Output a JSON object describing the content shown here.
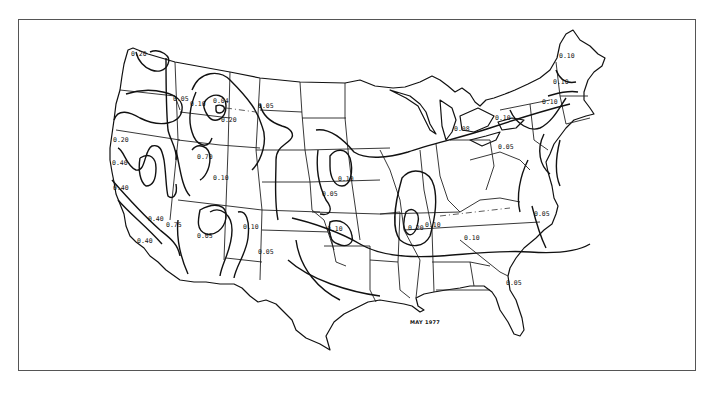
{
  "map": {
    "title_annotation": "MAY 1977",
    "subject": "Contour (isoline) map of the contiguous United States",
    "line_color": "#111111",
    "background": "#ffffff",
    "contour_labels": [
      {
        "text": "0.20",
        "x": 131,
        "y": 56
      },
      {
        "text": "0.05",
        "x": 173,
        "y": 101
      },
      {
        "text": "0.10",
        "x": 193,
        "y": 106
      },
      {
        "text": "0.04",
        "x": 215,
        "y": 103
      },
      {
        "text": "0.20",
        "x": 221,
        "y": 122
      },
      {
        "text": "0.05",
        "x": 258,
        "y": 108
      },
      {
        "text": "0.20",
        "x": 113,
        "y": 142
      },
      {
        "text": "0.40",
        "x": 112,
        "y": 165
      },
      {
        "text": "0.40",
        "x": 113,
        "y": 190
      },
      {
        "text": "0.70",
        "x": 197,
        "y": 159
      },
      {
        "text": "0.10",
        "x": 213,
        "y": 180
      },
      {
        "text": "0.40",
        "x": 148,
        "y": 221
      },
      {
        "text": "0.75",
        "x": 166,
        "y": 227
      },
      {
        "text": "0.40",
        "x": 137,
        "y": 243
      },
      {
        "text": "0.05",
        "x": 197,
        "y": 238
      },
      {
        "text": "0.10",
        "x": 243,
        "y": 229
      },
      {
        "text": "0.05",
        "x": 258,
        "y": 254
      },
      {
        "text": "0.10",
        "x": 338,
        "y": 181
      },
      {
        "text": "0.05",
        "x": 322,
        "y": 196
      },
      {
        "text": "0.10",
        "x": 327,
        "y": 231
      },
      {
        "text": "0.20",
        "x": 411,
        "y": 230
      },
      {
        "text": "0.10",
        "x": 427,
        "y": 227
      },
      {
        "text": "0.10",
        "x": 466,
        "y": 240
      },
      {
        "text": "0.05",
        "x": 536,
        "y": 216
      },
      {
        "text": "0.05",
        "x": 508,
        "y": 285
      },
      {
        "text": "0.08",
        "x": 456,
        "y": 131
      },
      {
        "text": "0.10",
        "x": 497,
        "y": 120
      },
      {
        "text": "0.05",
        "x": 500,
        "y": 149
      },
      {
        "text": "0.10",
        "x": 544,
        "y": 104
      },
      {
        "text": "0.10",
        "x": 555,
        "y": 84
      },
      {
        "text": "0.10",
        "x": 561,
        "y": 58
      }
    ],
    "contour_levels": [
      "0.04",
      "0.05",
      "0.08",
      "0.10",
      "0.20",
      "0.40",
      "0.70",
      "0.75"
    ]
  }
}
